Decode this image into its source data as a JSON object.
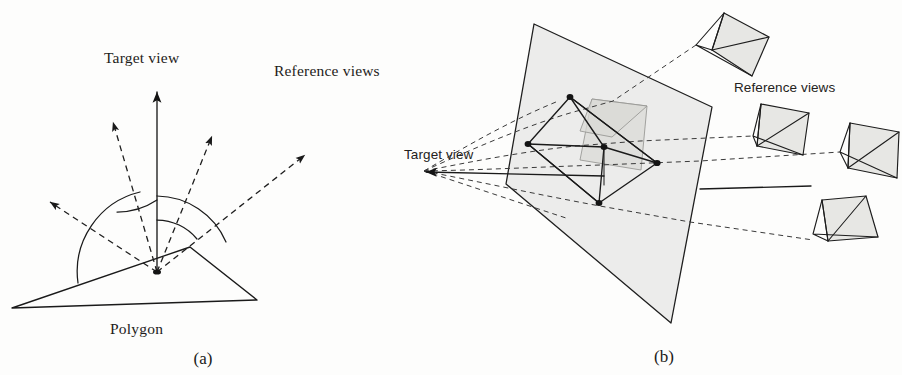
{
  "figure": {
    "background_color": "#fdfdfc",
    "ink_color": "#1a1a1a",
    "plane_fill_color": "#e9e9e7",
    "camera_fill_color": "#e4e4e1",
    "ghost_fill_color": "#d9d9d6"
  },
  "panel_a": {
    "caption": "(a)",
    "labels": {
      "target_view": "Target view",
      "reference_views": "Reference views",
      "polygon": "Polygon"
    },
    "origin": {
      "x": 157,
      "y": 272
    },
    "target_arrow": {
      "x1": 157,
      "y1": 272,
      "x2": 157,
      "y2": 92
    },
    "polygon_vertices": [
      {
        "x": 12,
        "y": 308
      },
      {
        "x": 190,
        "y": 247
      },
      {
        "x": 257,
        "y": 300
      }
    ],
    "reference_arrows": [
      {
        "name": "ray-far-left",
        "x1": 157,
        "y1": 272,
        "x2": 47,
        "y2": 200
      },
      {
        "name": "ray-left",
        "x1": 157,
        "y1": 272,
        "x2": 112,
        "y2": 120
      },
      {
        "name": "ray-right",
        "x1": 157,
        "y1": 272,
        "x2": 213,
        "y2": 134
      },
      {
        "name": "ray-far-right",
        "x1": 157,
        "y1": 272,
        "x2": 307,
        "y2": 153
      }
    ],
    "angle_arcs": [
      {
        "name": "arc-inner-right",
        "radius": 52
      },
      {
        "name": "arc-inner-left",
        "radius": 72
      },
      {
        "name": "arc-outer",
        "radius": 98
      }
    ]
  },
  "panel_b": {
    "caption": "(b)",
    "labels": {
      "target_view": "Target view",
      "reference_views": "Reference views"
    },
    "plane_vertices": [
      {
        "x": 534,
        "y": 24
      },
      {
        "x": 712,
        "y": 107
      },
      {
        "x": 671,
        "y": 323
      },
      {
        "x": 506,
        "y": 184
      }
    ],
    "object_vertices": [
      {
        "name": "top",
        "x": 570,
        "y": 97
      },
      {
        "name": "left",
        "x": 528,
        "y": 144
      },
      {
        "name": "center",
        "x": 604,
        "y": 147
      },
      {
        "name": "right",
        "x": 657,
        "y": 163
      },
      {
        "name": "bottom",
        "x": 599,
        "y": 203
      }
    ],
    "target_apex": {
      "x": 424,
      "y": 171
    },
    "cameras": [
      {
        "name": "camera-top",
        "apex_x": 696,
        "apex_y": 45
      },
      {
        "name": "camera-middle",
        "apex_x": 753,
        "apex_y": 136
      },
      {
        "name": "camera-right",
        "apex_x": 840,
        "apex_y": 152
      },
      {
        "name": "camera-bottom",
        "apex_x": 813,
        "apex_y": 234
      }
    ]
  }
}
